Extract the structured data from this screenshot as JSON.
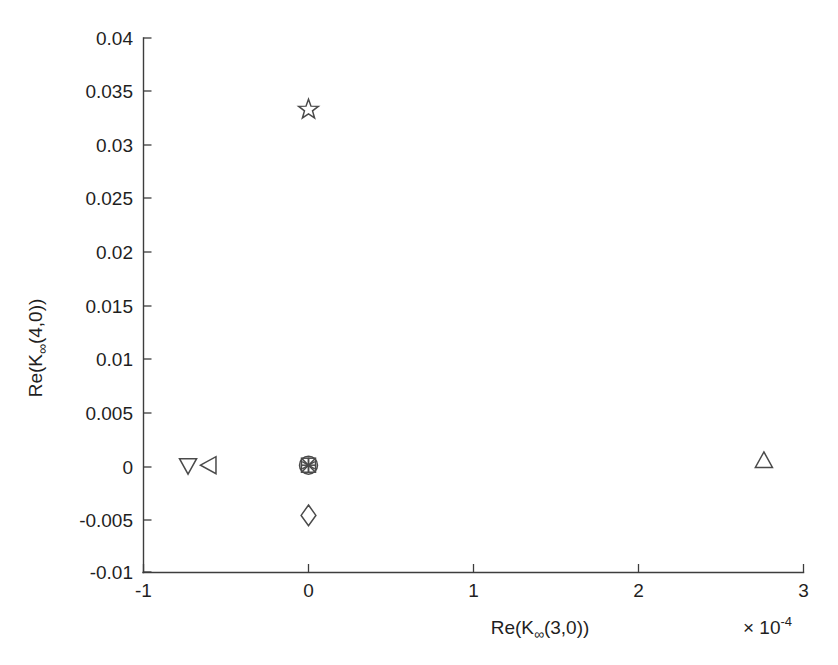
{
  "chart_data": {
    "type": "scatter",
    "title": "",
    "xlabel": "Re(K∞(3,0))",
    "ylabel": "Re(K∞(4,0))",
    "x_exponent_label": "× 10",
    "x_exponent_power": "-4",
    "x_scale_factor": 0.0001,
    "xlim": [
      -1,
      3
    ],
    "ylim": [
      -0.01,
      0.04
    ],
    "xticks": [
      -1,
      0,
      1,
      2,
      3
    ],
    "xticklabels": [
      "-1",
      "0",
      "1",
      "2",
      "3"
    ],
    "yticks": [
      -0.01,
      -0.005,
      0,
      0.005,
      0.01,
      0.015,
      0.02,
      0.025,
      0.03,
      0.035,
      0.04
    ],
    "yticklabels": [
      "-0.01",
      "-0.005",
      "0",
      "0.005",
      "0.01",
      "0.015",
      "0.02",
      "0.025",
      "0.03",
      "0.035",
      "0.04"
    ],
    "grid": false,
    "legend": "none",
    "box": false,
    "marker_color": "#4a4a4a",
    "points": [
      {
        "label": "down-triangle",
        "marker": "triangle-down",
        "x": -0.73,
        "y": 0.0
      },
      {
        "label": "left-triangle",
        "marker": "triangle-left",
        "x": -0.6,
        "y": 0.0
      },
      {
        "label": "circle",
        "marker": "circle",
        "x": 0.0,
        "y": 0.0
      },
      {
        "label": "cross",
        "marker": "x-cross",
        "x": 0.0,
        "y": 0.0
      },
      {
        "label": "plus",
        "marker": "plus",
        "x": 0.0,
        "y": 0.0
      },
      {
        "label": "asterisk",
        "marker": "asterisk",
        "x": 0.0,
        "y": 0.0
      },
      {
        "label": "square",
        "marker": "square",
        "x": 0.0,
        "y": 0.0
      },
      {
        "label": "diamond",
        "marker": "diamond",
        "x": 0.0,
        "y": -0.0047
      },
      {
        "label": "star",
        "marker": "pentagram",
        "x": 0.0,
        "y": 0.0333
      },
      {
        "label": "up-triangle",
        "marker": "triangle-up",
        "x": 2.76,
        "y": 0.0004
      }
    ]
  },
  "axis_titles": {
    "x_main": "Re(K",
    "x_infinity": "∞",
    "x_tail": "(3,0))",
    "y_main": "Re(K",
    "y_infinity": "∞",
    "y_tail": "(4,0))"
  }
}
